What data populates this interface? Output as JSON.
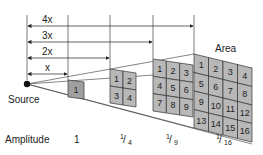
{
  "distance_labels": [
    "x",
    "2x",
    "3x",
    "4x"
  ],
  "source_label": "Source",
  "area_label": "Area",
  "amplitude": {
    "label": "Amplitude",
    "values": [
      "1",
      "1/4",
      "1/9",
      "1/16"
    ],
    "display": [
      {
        "num": "",
        "den": "",
        "whole": "1"
      },
      {
        "num": "1",
        "den": "4",
        "whole": ""
      },
      {
        "num": "1",
        "den": "9",
        "whole": ""
      },
      {
        "num": "1",
        "den": "16",
        "whole": ""
      }
    ]
  },
  "panels": [
    {
      "grid": 1,
      "cells": [
        "1"
      ]
    },
    {
      "grid": 2,
      "cells": [
        "1",
        "2",
        "3",
        "4"
      ]
    },
    {
      "grid": 3,
      "cells": [
        "1",
        "2",
        "3",
        "4",
        "5",
        "6",
        "7",
        "8",
        "9"
      ]
    },
    {
      "grid": 4,
      "cells": [
        "1",
        "2",
        "3",
        "4",
        "5",
        "6",
        "7",
        "8",
        "9",
        "10",
        "11",
        "12",
        "13",
        "14",
        "15",
        "16"
      ]
    }
  ],
  "colors": {
    "cell_fill": "#b8b8b8",
    "cell_fill_dark": "#a0a0a0",
    "line": "#333333",
    "source_dot": "#111111"
  }
}
